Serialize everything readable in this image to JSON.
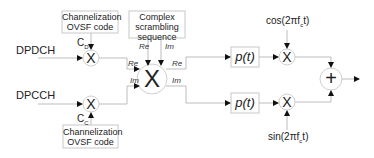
{
  "diagram": {
    "inputs": {
      "dpdch": "DPDCH",
      "dpcch": "DPCCH"
    },
    "ovsf_top": {
      "line1": "Channelization",
      "line2": "OVSF code"
    },
    "ovsf_bottom": {
      "line1": "Channelization",
      "line2": "OVSF code"
    },
    "scrambling": {
      "line1": "Complex",
      "line2": "scrambling",
      "line3": "sequence"
    },
    "codes": {
      "cd_main": "C",
      "cd_sub": "D",
      "cc_main": "C",
      "cc_sub": "C"
    },
    "ops": {
      "multiply": "X",
      "add": "+"
    },
    "reim": {
      "scr_re": "Re",
      "scr_im": "Im",
      "in_re": "Re",
      "in_im": "Im",
      "out_re": "Re",
      "out_im": "Im"
    },
    "pulse": {
      "top": "p(t)",
      "bottom": "p(t)"
    },
    "carriers": {
      "cos": "cos(2πf",
      "cos_sub": "c",
      "cos_tail": "t)",
      "sin": "sin(2πf",
      "sin_sub": "c",
      "sin_tail": "t)"
    },
    "colors": {
      "line": "#bdbdbd",
      "arrow": "#111111",
      "box_border": "#c8c8c8",
      "text": "#222222"
    }
  }
}
